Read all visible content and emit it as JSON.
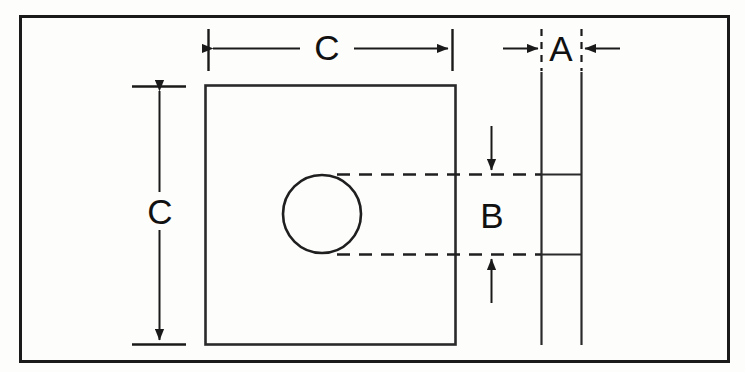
{
  "drawing": {
    "title": "Mounting plate dimension drawing",
    "background_color": "#fdfdfc",
    "line_color": "#1a1a1a",
    "labels": {
      "width_label": "C",
      "height_label": "C",
      "thickness_label": "A",
      "hole_label": "B"
    },
    "views": {
      "front": {
        "name": "front-view-plate",
        "outline": "rectangle",
        "hole": "circle"
      },
      "side": {
        "name": "side-view-plate",
        "outline": "two-vertical-lines"
      }
    },
    "dimensions": [
      {
        "id": "width-dimension",
        "label": "C",
        "orientation": "horizontal",
        "arrow_style": "outward-pair"
      },
      {
        "id": "height-dimension",
        "label": "C",
        "orientation": "vertical",
        "arrow_style": "outward-pair"
      },
      {
        "id": "thickness-dimension",
        "label": "A",
        "orientation": "horizontal",
        "arrow_style": "inward-pair"
      },
      {
        "id": "hole-size-dimension",
        "label": "B",
        "orientation": "vertical",
        "arrow_style": "inward-pair"
      }
    ],
    "border": {
      "name": "drawing-frame",
      "style": "solid rectangle"
    }
  }
}
